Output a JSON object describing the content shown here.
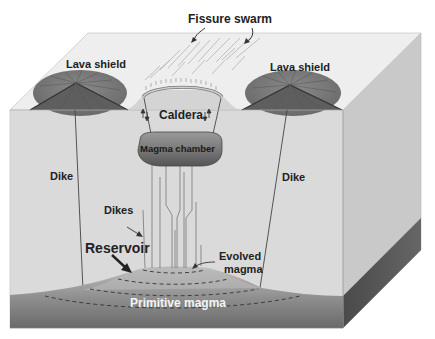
{
  "labels": {
    "fissure_swarm": "Fissure swarm",
    "lava_shield_left": "Lava shield",
    "lava_shield_right": "Lava shield",
    "caldera": "Caldera",
    "magma_chamber": "Magma chamber",
    "dike_left": "Dike",
    "dike_right": "Dike",
    "dikes": "Dikes",
    "reservoir": "Reservoir",
    "evolved_magma_line1": "Evolved",
    "evolved_magma_line2": "magma",
    "primitive_magma": "Primitive magma"
  },
  "colors": {
    "top_face": "#ececec",
    "front_face": "#d9d9d9",
    "right_face": "#c8c8c8",
    "right_face_magma": "#5a5a5a",
    "lava_shield": "#7a7a7a",
    "magma_chamber": "#6e6e6e",
    "primitive_magma_top": "#b8b8b8",
    "primitive_magma_bottom": "#6a6a6a",
    "line": "#333333"
  }
}
